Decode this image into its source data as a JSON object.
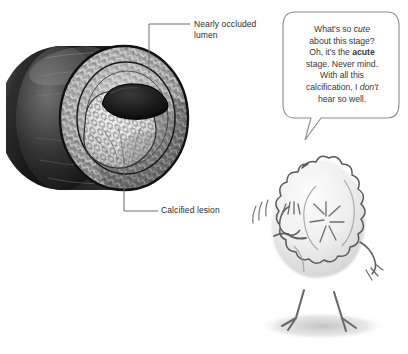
{
  "figure": {
    "name": "artery-cross-section",
    "labels": [
      {
        "id": "lumen",
        "text": "Nearly occluded\nlumen"
      },
      {
        "id": "lesion",
        "text": "Calcified lesion"
      }
    ]
  },
  "speech": {
    "lines": [
      {
        "segments": [
          {
            "text": "What's so "
          },
          {
            "text": "cute",
            "style": "italic"
          }
        ]
      },
      {
        "segments": [
          {
            "text": "about this stage?"
          }
        ]
      },
      {
        "segments": [
          {
            "text": "Oh, it's the "
          },
          {
            "text": "acute",
            "style": "bold"
          }
        ]
      },
      {
        "segments": [
          {
            "text": "stage. Never mind."
          }
        ]
      },
      {
        "segments": [
          {
            "text": "With all this"
          }
        ]
      },
      {
        "segments": [
          {
            "text": "calcification, I "
          },
          {
            "text": "don't",
            "style": "italic"
          }
        ]
      },
      {
        "segments": [
          {
            "text": "hear so well."
          }
        ]
      }
    ],
    "plain_text": "What's so cute about this stage? Oh, it's the acute stage. Never mind. With all this calcification, I don't hear so well."
  },
  "character": {
    "name": "fuzzy-chick",
    "pose": "waving"
  },
  "colors": {
    "background": "#ffffff",
    "label_text": "#2b2b2b",
    "speech_text": "#39393c",
    "leader_line": "#6e6e6e",
    "balloon_outline": "#8a8a8a",
    "vessel_dark": "#1c1c1c",
    "vessel_mid": "#8d8d8d",
    "lesion_light": "#e8e8e8",
    "chick_fill": "#efefef",
    "chick_outline": "#5a5a5a",
    "shadow": "#cfcfcf"
  }
}
